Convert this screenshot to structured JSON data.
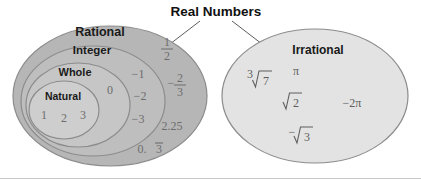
{
  "title": "Real Numbers",
  "sets": {
    "rational": {
      "label": "Rational",
      "fill": "#b6b6b6",
      "stroke": "#8c8c8c"
    },
    "integer": {
      "label": "Integer",
      "fill": "#bebebe",
      "stroke": "#8c8c8c"
    },
    "whole": {
      "label": "Whole",
      "fill": "#c6c6c6",
      "stroke": "#8c8c8c"
    },
    "natural": {
      "label": "Natural",
      "fill": "#cecece",
      "stroke": "#8c8c8c"
    },
    "irrational": {
      "label": "Irrational",
      "fill": "#e3e3e3",
      "stroke": "#8c8c8c"
    }
  },
  "members": {
    "natural": [
      "1",
      "2",
      "3"
    ],
    "whole": [
      "0"
    ],
    "integer": [
      "−1",
      "−2",
      "−3"
    ],
    "rational": {
      "one_half_numerator": "1",
      "one_half_denominator": "2",
      "neg_two_thirds_sign": "−",
      "neg_two_thirds_numerator": "2",
      "neg_two_thirds_denominator": "3",
      "decimal": "2.25",
      "repeating_prefix": "0.",
      "repeating_digit": "3"
    },
    "irrational": {
      "cube_root_index": "3",
      "cube_root_radicand": "7",
      "pi": "π",
      "sqrt_two": "2",
      "neg_two_pi": "−2π",
      "neg_sqrt_three_sign": "−",
      "neg_sqrt_three_radicand": "3"
    }
  }
}
